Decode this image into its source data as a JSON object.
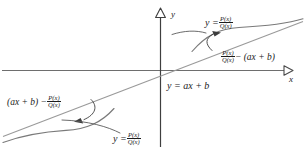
{
  "figure": {
    "axes": {
      "x_axis_label": "x",
      "y_axis_label": "y"
    },
    "line_label": "y = ax + b",
    "labels": {
      "curve_top_right": {
        "lhs": "y =",
        "numerator": "P(x)",
        "denominator": "Q(x)"
      },
      "curve_bottom_left": {
        "lhs": "y =",
        "numerator": "P(x)",
        "denominator": "Q(x)"
      },
      "gap_upper": {
        "numerator": "P(x)",
        "denominator": "Q(x)",
        "rhs": "− (ax + b)"
      },
      "gap_lower": {
        "lhs": "(ax + b) −",
        "numerator": "P(x)",
        "denominator": "Q(x)"
      }
    },
    "colors": {
      "ink": "#1b1b1b",
      "axis": "#6e6e6e",
      "line": "#8a8a8a",
      "curve": "#7a7a7a",
      "background": "#ffffff"
    }
  }
}
